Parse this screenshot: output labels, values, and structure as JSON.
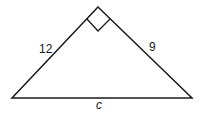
{
  "diagram": {
    "type": "right-triangle",
    "stroke_color": "#1a1a1a",
    "vertices": {
      "apex": [
        98,
        7
      ],
      "left": [
        12,
        98
      ],
      "right": [
        192,
        98
      ]
    },
    "right_angle_marker": {
      "points": [
        [
          87,
          19
        ],
        [
          98,
          31
        ],
        [
          110,
          19
        ]
      ]
    },
    "labels": {
      "left_leg": "12",
      "right_leg": "9",
      "hypotenuse": "c"
    }
  }
}
